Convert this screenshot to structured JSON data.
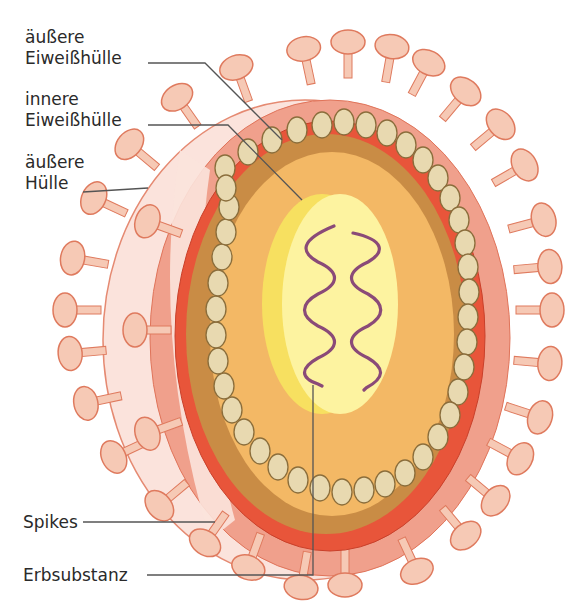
{
  "diagram": {
    "labels": [
      {
        "id": "aeussere-eiweisshuelle",
        "lines": [
          "äußere",
          "Eiweißhülle"
        ]
      },
      {
        "id": "innere-eiweisshuelle",
        "lines": [
          "innere",
          "Eiweißhülle"
        ]
      },
      {
        "id": "aeussere-huelle",
        "lines": [
          "äußere",
          "Hülle"
        ]
      },
      {
        "id": "spikes",
        "lines": [
          "Spikes"
        ]
      },
      {
        "id": "erbsubstanz",
        "lines": [
          "Erbsubstanz"
        ]
      }
    ],
    "colors": {
      "outer_envelope_front": "#fbe3dc",
      "outer_envelope_ring": "#f0a08c",
      "inner_red_layer": "#e8553a",
      "capsid_brown": "#c98c45",
      "core_orange": "#f3b865",
      "capsomer_fill": "#e8d9b0",
      "capsomer_stroke": "#8a6d3b",
      "nucleoid_yellow": "#fdf3a0",
      "nucleoid_side": "#f7e060",
      "rna_purple": "#8a4a78",
      "spike_fill": "#f6c9b5",
      "spike_stroke": "#df7a5e",
      "leader_line": "#555555"
    }
  }
}
